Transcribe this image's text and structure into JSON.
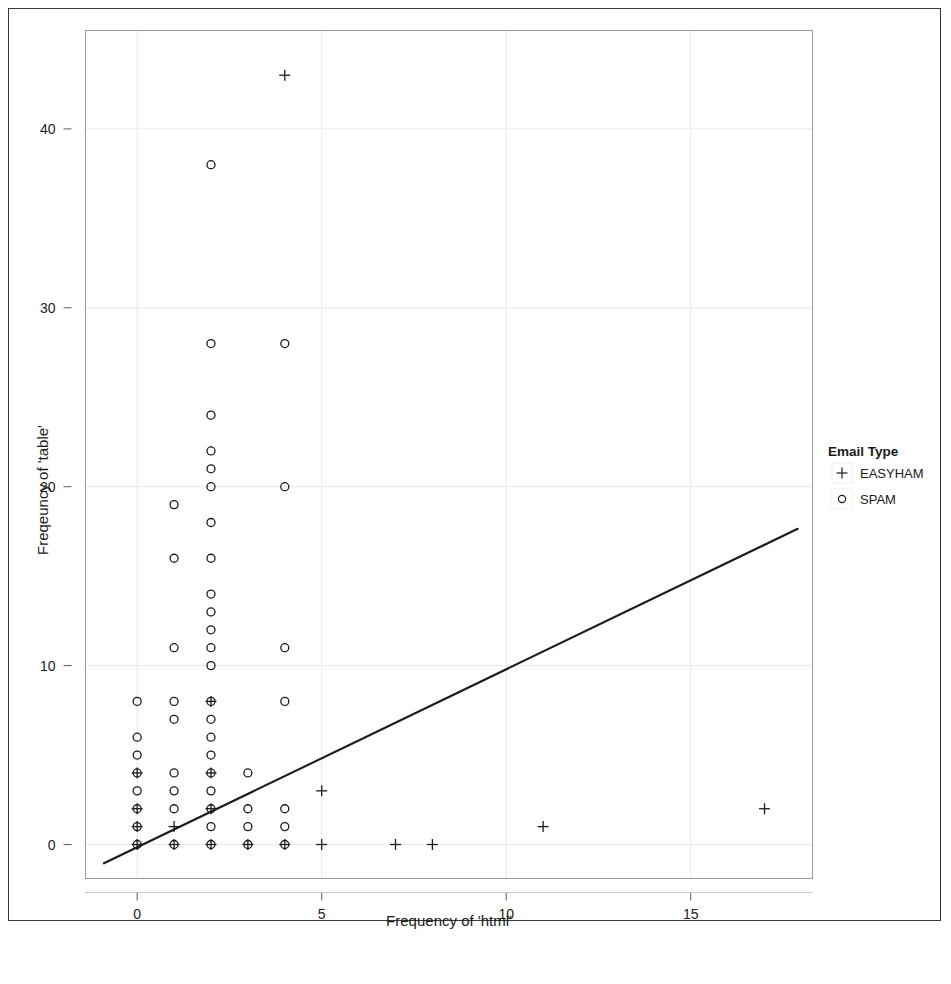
{
  "figure": {
    "panel_border_color": "#9a9a9a",
    "frame_border_color": "#3a3a3a",
    "marker_color": "#1b1b1b",
    "line_color": "#1b1b1b",
    "grid_color": "#e8e8e8"
  },
  "legend": {
    "title": "Email Type",
    "entries": [
      {
        "glyph": "plus-marker",
        "symbol": "+",
        "label": "EASYHAM"
      },
      {
        "glyph": "circle-marker",
        "symbol": "o",
        "label": "SPAM"
      }
    ]
  },
  "caption": {
    "text": ""
  },
  "chart_data": {
    "type": "scatter",
    "title": "",
    "xlabel": "Frequency of 'html'",
    "ylabel": "Freqeuncy of 'table'",
    "xlim": [
      -1.4,
      18.3
    ],
    "ylim": [
      -1.9,
      45.5
    ],
    "xticks": [
      0,
      5,
      10,
      15
    ],
    "yticks": [
      0,
      10,
      20,
      30,
      40
    ],
    "xtick_labels": [
      "0",
      "5",
      "10",
      "15"
    ],
    "ytick_labels": [
      "0",
      "10",
      "20",
      "30",
      "40"
    ],
    "grid": true,
    "legend_position": "right",
    "series": [
      {
        "name": "EASYHAM",
        "marker": "plus",
        "points": [
          [
            4,
            43
          ],
          [
            0,
            4
          ],
          [
            0,
            2
          ],
          [
            0,
            1
          ],
          [
            0,
            0
          ],
          [
            1,
            1
          ],
          [
            1,
            0
          ],
          [
            2,
            8
          ],
          [
            2,
            4
          ],
          [
            2,
            2
          ],
          [
            2,
            0
          ],
          [
            3,
            0
          ],
          [
            4,
            0
          ],
          [
            5,
            3
          ],
          [
            5,
            0
          ],
          [
            7,
            0
          ],
          [
            8,
            0
          ],
          [
            11,
            1
          ],
          [
            17,
            2
          ]
        ]
      },
      {
        "name": "SPAM",
        "marker": "circle",
        "points": [
          [
            2,
            38
          ],
          [
            2,
            28
          ],
          [
            4,
            28
          ],
          [
            2,
            24
          ],
          [
            2,
            22
          ],
          [
            2,
            21
          ],
          [
            2,
            20
          ],
          [
            4,
            20
          ],
          [
            1,
            19
          ],
          [
            2,
            18
          ],
          [
            1,
            16
          ],
          [
            2,
            16
          ],
          [
            2,
            14
          ],
          [
            2,
            13
          ],
          [
            2,
            12
          ],
          [
            1,
            11
          ],
          [
            2,
            11
          ],
          [
            4,
            11
          ],
          [
            2,
            10
          ],
          [
            0,
            8
          ],
          [
            1,
            8
          ],
          [
            2,
            8
          ],
          [
            4,
            8
          ],
          [
            1,
            7
          ],
          [
            2,
            7
          ],
          [
            0,
            6
          ],
          [
            2,
            6
          ],
          [
            0,
            5
          ],
          [
            2,
            5
          ],
          [
            0,
            4
          ],
          [
            1,
            4
          ],
          [
            2,
            4
          ],
          [
            3,
            4
          ],
          [
            0,
            3
          ],
          [
            1,
            3
          ],
          [
            2,
            3
          ],
          [
            0,
            2
          ],
          [
            1,
            2
          ],
          [
            2,
            2
          ],
          [
            3,
            2
          ],
          [
            4,
            2
          ],
          [
            0,
            1
          ],
          [
            2,
            1
          ],
          [
            3,
            1
          ],
          [
            4,
            1
          ],
          [
            0,
            0
          ],
          [
            1,
            0
          ],
          [
            2,
            0
          ],
          [
            3,
            0
          ],
          [
            4,
            0
          ]
        ]
      }
    ],
    "trendline": {
      "name": "regression-line",
      "x0": -0.9,
      "y0": -1.05,
      "x1": 17.9,
      "y1": 17.65
    }
  }
}
